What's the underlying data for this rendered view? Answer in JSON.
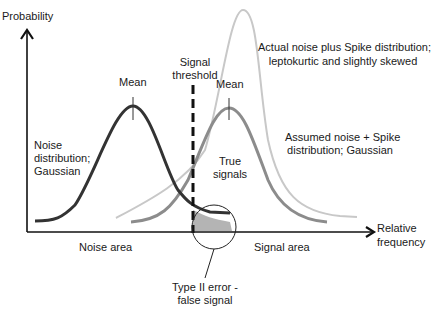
{
  "axes": {
    "y_label": "Probability",
    "x_label_line1": "Relative",
    "x_label_line2": "frequency"
  },
  "labels": {
    "noise_mean": "Mean",
    "signal_mean": "Mean",
    "threshold_line1": "Signal",
    "threshold_line2": "threshold",
    "noise_dist_line1": "Noise",
    "noise_dist_line2": "distribution;",
    "noise_dist_line3": "Gaussian",
    "actual_line1": "Actual noise plus Spike distribution;",
    "actual_line2": "leptokurtic and slightly skewed",
    "assumed_line1": "Assumed noise + Spike",
    "assumed_line2": "distribution; Gaussian",
    "true_line1": "True",
    "true_line2": "signals",
    "noise_area": "Noise area",
    "signal_area": "Signal area",
    "error_line1": "Type II error -",
    "error_line2": "false signal"
  },
  "colors": {
    "noise_curve": "#333333",
    "assumed_curve": "#8c8c8c",
    "actual_curve": "#c8c8c8",
    "shaded_error": "#b4b4b4",
    "axis": "#111111"
  }
}
